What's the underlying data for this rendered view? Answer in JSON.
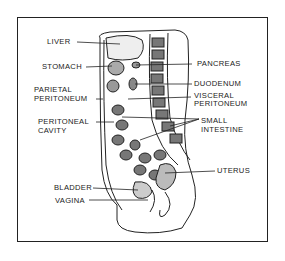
{
  "figure": {
    "colors": {
      "ink": "#222222",
      "background": "#ffffff"
    }
  },
  "labels": {
    "liver": "LIVER",
    "stomach": "STOMACH",
    "parietal_peritoneum_1": "PARIETAL",
    "parietal_peritoneum_2": "PERITONEUM",
    "peritoneal_cavity_1": "PERITONEAL",
    "peritoneal_cavity_2": "CAVITY",
    "bladder": "BLADDER",
    "vagina": "VAGINA",
    "pancreas": "PANCREAS",
    "duodenum": "DUODENUM",
    "visceral_peritoneum_1": "VISCERAL",
    "visceral_peritoneum_2": "PERITONEUM",
    "small_intestine_1": "SMALL",
    "small_intestine_2": "INTESTINE",
    "uterus": "UTERUS"
  }
}
